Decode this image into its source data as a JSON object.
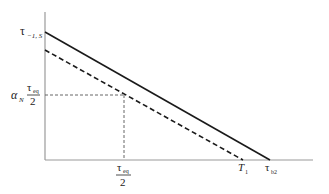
{
  "diagram": {
    "type": "line-diagram",
    "axes": {
      "origin": [
        45,
        160
      ],
      "y_top": 12,
      "x_right": 313
    },
    "lines": [
      {
        "name": "solid",
        "style": "solid",
        "from": [
          45,
          32
        ],
        "to": [
          270,
          160
        ]
      },
      {
        "name": "dashed",
        "style": "dashed",
        "from": [
          45,
          50
        ],
        "to": [
          243,
          160
        ]
      }
    ],
    "guide_point": [
      124,
      95
    ],
    "labels": {
      "y_top": {
        "main": "τ",
        "sub": "−1, S"
      },
      "y_mid": {
        "alpha": "α",
        "alpha_sub": "N",
        "numer_main": "τ",
        "numer_sub": "eq",
        "denom": "2"
      },
      "x_mid": {
        "numer_main": "τ",
        "numer_sub": "eq",
        "denom": "2"
      },
      "x_t1": {
        "main": "T",
        "sub": "1"
      },
      "x_tb2": {
        "main": "τ",
        "sub": "b2"
      }
    },
    "colors": {
      "axis": "#9a9a9a",
      "line": "#1a1a1a",
      "guide": "#555555"
    }
  }
}
